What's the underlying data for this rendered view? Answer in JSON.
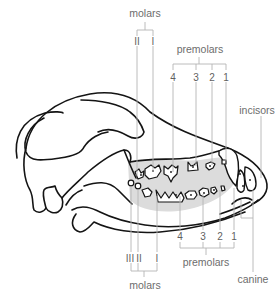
{
  "diagram": {
    "labels": {
      "top_molars": "molars",
      "top_premolars": "premolars",
      "incisors": "incisors",
      "bottom_premolars": "premolars",
      "bottom_molars": "molars",
      "canine": "canine"
    },
    "upper_molars": [
      "II",
      "I"
    ],
    "upper_premolars": [
      "4",
      "3",
      "2",
      "1"
    ],
    "lower_premolars": [
      "4",
      "3",
      "2",
      "1"
    ],
    "lower_molars": [
      "III",
      "II",
      "I"
    ],
    "colors": {
      "outline": "#141414",
      "gum_shading": "#dcdcdc",
      "leader_lines": "#b4b4b4",
      "label_text": "#6d6d6d"
    }
  }
}
